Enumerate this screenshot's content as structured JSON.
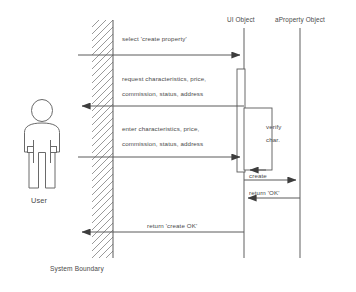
{
  "diagram": {
    "type": "uml-sequence-diagram",
    "actor": {
      "name": "User",
      "label": "User",
      "icon": "person-actor-icon"
    },
    "boundary": {
      "label": "System Boundary",
      "icon": "hatched-boundary-icon"
    },
    "lifelines": [
      {
        "id": "ui",
        "label": "UI Object",
        "x": 244
      },
      {
        "id": "property",
        "label": "aProperty Object",
        "x": 300
      }
    ],
    "messages": [
      {
        "id": "m1",
        "label": "select 'create property'",
        "from": "user",
        "to": "ui",
        "kind": "call",
        "y": 55
      },
      {
        "id": "m2",
        "label_line1": "request characteristics, price,",
        "label_line2": "commission, status, address",
        "from": "ui",
        "to": "user",
        "kind": "return",
        "y": 106
      },
      {
        "id": "m3",
        "label_line1": "enter characteristics, price,",
        "label_line2": "commission, status, address",
        "from": "user",
        "to": "ui",
        "kind": "call",
        "y": 157
      },
      {
        "id": "m4",
        "label_line1": "verify",
        "label_line2": "char.",
        "from": "ui",
        "to": "ui",
        "kind": "self-call",
        "y": 108
      },
      {
        "id": "m5",
        "label": "create",
        "from": "ui",
        "to": "property",
        "kind": "call",
        "y": 180
      },
      {
        "id": "m6",
        "label": "return 'OK'",
        "from": "property",
        "to": "ui",
        "kind": "return",
        "y": 198
      },
      {
        "id": "m7",
        "label": "return 'create OK'",
        "from": "ui",
        "to": "user",
        "kind": "return",
        "y": 232
      }
    ],
    "colors": {
      "stroke": "#5a5a5a",
      "text": "#4a4a4a",
      "hatch": "#9a9a9a",
      "background": "#ffffff"
    }
  }
}
